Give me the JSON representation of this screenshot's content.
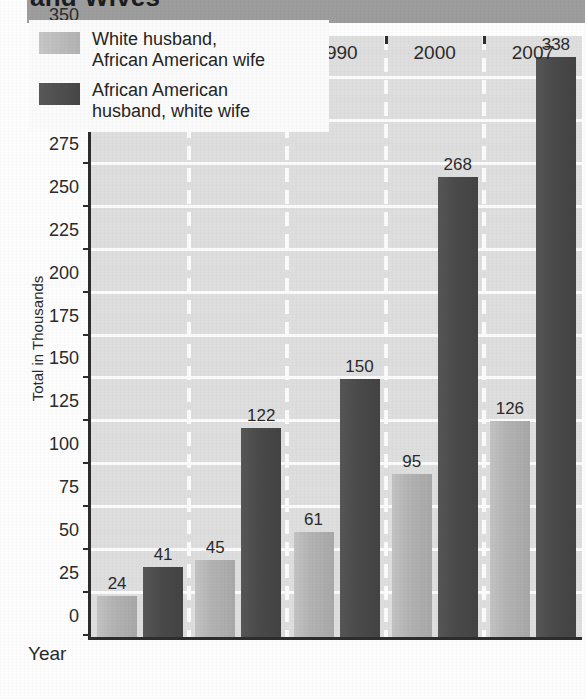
{
  "title": {
    "text": "and Wives",
    "note": "clipped-title-banner"
  },
  "axis": {
    "x_name": "Year",
    "y_label": "Total in Thousands",
    "y_ticks": [
      0,
      25,
      50,
      75,
      100,
      125,
      150,
      175,
      200,
      225,
      250,
      275,
      300,
      325,
      350
    ]
  },
  "legend": {
    "items": [
      {
        "label": "White husband,\nAfrican American wife",
        "color": "#b2b2b2"
      },
      {
        "label": "African American\nhusband, white wife",
        "color": "#4a4a4a"
      }
    ]
  },
  "chart_data": {
    "type": "bar",
    "title": "and Wives",
    "xlabel": "Year",
    "ylabel": "Total in Thousands",
    "ylim": [
      0,
      350
    ],
    "grid": true,
    "legend_position": "top-left",
    "categories": [
      "1970",
      "1980",
      "1990",
      "2000",
      "2007"
    ],
    "series": [
      {
        "name": "White husband, African American wife",
        "color": "#b2b2b2",
        "values": [
          24,
          45,
          61,
          95,
          126
        ]
      },
      {
        "name": "African American husband, white wife",
        "color": "#4a4a4a",
        "values": [
          41,
          122,
          150,
          268,
          338
        ]
      }
    ]
  }
}
